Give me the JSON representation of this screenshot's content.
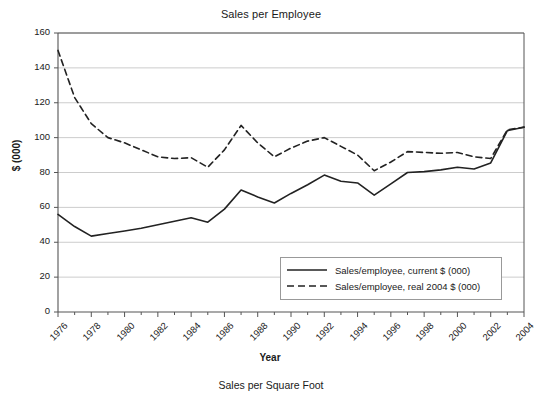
{
  "chart_data": {
    "type": "line",
    "title": "Sales per Employee",
    "xlabel": "Year",
    "ylabel": "$ (000)",
    "caption": "Sales per Square Foot",
    "grid": true,
    "legend_position": "inside bottom-right",
    "xlim": [
      1976,
      2004
    ],
    "ylim": [
      0,
      160
    ],
    "ytick_labels": [
      "160",
      "140",
      "120",
      "100",
      "80",
      "60",
      "40",
      "20",
      "0"
    ],
    "ytick_values": [
      160,
      140,
      120,
      100,
      80,
      60,
      40,
      20,
      0
    ],
    "xtick_labels": [
      "1976",
      "1978",
      "1980",
      "1982",
      "1984",
      "1986",
      "1988",
      "1990",
      "1992",
      "1994",
      "1996",
      "1998",
      "2000",
      "2002",
      "2004"
    ],
    "xtick_values": [
      1976,
      1978,
      1980,
      1982,
      1984,
      1986,
      1988,
      1990,
      1992,
      1994,
      1996,
      1998,
      2000,
      2002,
      2004
    ],
    "x": [
      1976,
      1977,
      1978,
      1979,
      1980,
      1981,
      1982,
      1983,
      1984,
      1985,
      1986,
      1987,
      1988,
      1989,
      1990,
      1991,
      1992,
      1993,
      1994,
      1995,
      1996,
      1997,
      1998,
      1999,
      2000,
      2001,
      2002,
      2003,
      2004
    ],
    "series": [
      {
        "name": "Sales/employee, current $ (000)",
        "style": "solid",
        "color": "#222222",
        "values": [
          56,
          49,
          43.5,
          45,
          46.5,
          48,
          50,
          52,
          54,
          51.5,
          59,
          70,
          66,
          62.5,
          68,
          73,
          78.5,
          75,
          74,
          67,
          73.5,
          80,
          80.5,
          81.5,
          83,
          82,
          85.5,
          104,
          106
        ]
      },
      {
        "name": "Sales/employee, real 2004 $ (000)",
        "style": "dashed",
        "color": "#222222",
        "values": [
          150,
          123,
          108,
          100,
          97,
          93,
          89,
          88,
          88.5,
          83,
          93,
          107,
          97,
          89,
          94,
          98,
          100,
          95,
          90,
          81,
          86,
          92,
          91.5,
          91,
          91.5,
          89,
          88,
          104.5,
          106
        ]
      }
    ]
  },
  "legend": {
    "items": [
      {
        "label": "Sales/employee, current $ (000)",
        "style": "solid"
      },
      {
        "label": "Sales/employee, real 2004 $ (000)",
        "style": "dashed"
      }
    ]
  }
}
